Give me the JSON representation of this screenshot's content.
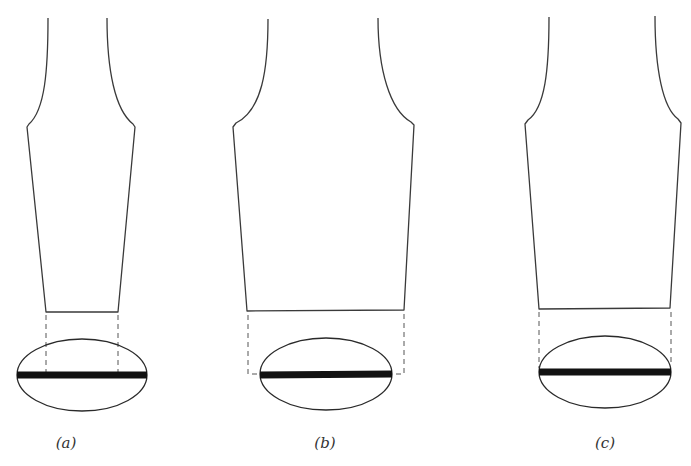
{
  "figure": {
    "panels": [
      {
        "id": "a",
        "label": "(a)",
        "label_x": 66
      },
      {
        "id": "b",
        "label": "(b)",
        "label_x": 325
      },
      {
        "id": "c",
        "label": "(c)",
        "label_x": 605
      }
    ]
  },
  "colors": {
    "outline": "#3a3a3a",
    "bar": "#111111",
    "background": "#ffffff"
  }
}
